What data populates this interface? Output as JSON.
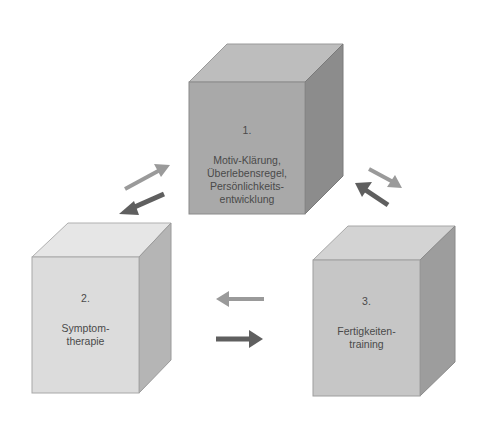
{
  "diagram": {
    "boxes": [
      {
        "id": "box-1",
        "number": "1.",
        "lines": [
          "Motiv-Klärung,",
          "Überlebensregel,",
          "Persönlichkeits-",
          "entwicklung"
        ],
        "colors": {
          "front": "#a9a9a9",
          "top": "#bdbdbd",
          "side": "#8c8c8c"
        }
      },
      {
        "id": "box-2",
        "number": "2.",
        "lines": [
          "Symptom-",
          "therapie"
        ],
        "colors": {
          "front": "#dcdcdc",
          "top": "#e6e6e6",
          "side": "#b5b5b5"
        }
      },
      {
        "id": "box-3",
        "number": "3.",
        "lines": [
          "Fertigkeiten-",
          "training"
        ],
        "colors": {
          "front": "#c6c6c6",
          "top": "#d3d3d3",
          "side": "#9d9d9d"
        }
      }
    ],
    "arrows": [
      {
        "from": "2",
        "to": "1",
        "shade": "light",
        "color": "#9a9a9a"
      },
      {
        "from": "1",
        "to": "2",
        "shade": "dark",
        "color": "#5f5f5f"
      },
      {
        "from": "1",
        "to": "3",
        "shade": "light",
        "color": "#9a9a9a"
      },
      {
        "from": "3",
        "to": "1",
        "shade": "dark",
        "color": "#5f5f5f"
      },
      {
        "from": "3",
        "to": "2",
        "shade": "light",
        "color": "#9a9a9a"
      },
      {
        "from": "2",
        "to": "3",
        "shade": "dark",
        "color": "#5f5f5f"
      }
    ]
  }
}
